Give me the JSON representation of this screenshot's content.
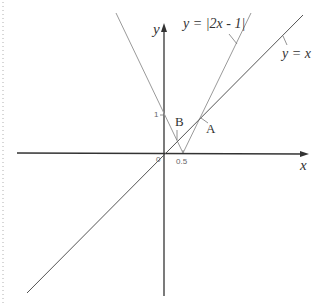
{
  "diagram": {
    "axes": {
      "x_label": "x",
      "y_label": "y",
      "origin_label": "0"
    },
    "ticks": {
      "x_tick": "0.5",
      "y_tick": "1"
    },
    "curves": [
      {
        "label": "y = |2x - 1|",
        "color": "#9a9a9a"
      },
      {
        "label": "y = x",
        "color": "#555555"
      }
    ],
    "points": {
      "A": "A",
      "B": "B"
    }
  },
  "colors": {
    "axis": "#333333",
    "abs_curve": "#9a9a9a",
    "line": "#555555",
    "border_dots": "#b0b0b0"
  }
}
